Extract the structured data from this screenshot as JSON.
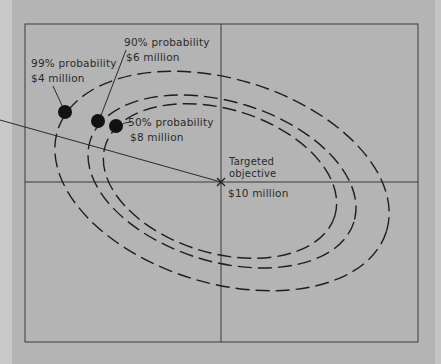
{
  "diagram": {
    "type": "probability-contour",
    "center": {
      "label_line1": "Targeted",
      "label_line2": "objective",
      "value": "$10  million"
    },
    "contours": [
      {
        "probability": "99% probability",
        "value": "$4  million"
      },
      {
        "probability": "90% probability",
        "value": "$6  million"
      },
      {
        "probability": "50% probability",
        "value": "$8  million"
      }
    ],
    "colors": {
      "background": "#b4b4b4",
      "ink": "#2a2a2a"
    }
  }
}
